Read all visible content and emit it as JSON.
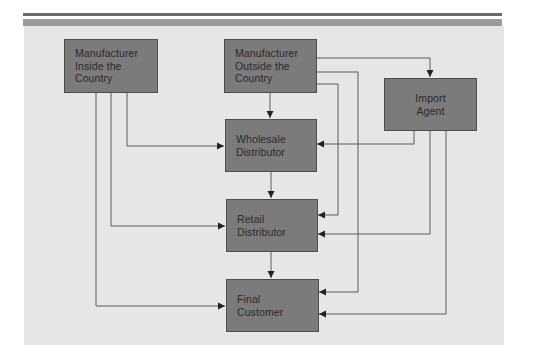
{
  "diagram": {
    "type": "flowchart",
    "title": "",
    "colors": {
      "panel_bg": "#e6e6e6",
      "box_fill": "#7b7b7b",
      "box_border": "#4e4e4e",
      "line": "#555555",
      "text": "#2a2a2a"
    },
    "nodes": [
      {
        "id": "mfr_inside",
        "label": "Manufacturer\nInside the\nCountry"
      },
      {
        "id": "mfr_outside",
        "label": "Manufacturer\nOutside the\nCountry"
      },
      {
        "id": "import_agent",
        "label": "Import\nAgent"
      },
      {
        "id": "wholesale",
        "label": "Wholesale\nDistributor"
      },
      {
        "id": "retail",
        "label": "Retail\nDistributor"
      },
      {
        "id": "final",
        "label": "Final\nCustomer"
      }
    ],
    "edges": [
      {
        "from": "mfr_inside",
        "to": "wholesale"
      },
      {
        "from": "mfr_inside",
        "to": "retail"
      },
      {
        "from": "mfr_inside",
        "to": "final"
      },
      {
        "from": "mfr_outside",
        "to": "wholesale"
      },
      {
        "from": "mfr_outside",
        "to": "import_agent"
      },
      {
        "from": "mfr_outside",
        "to": "retail"
      },
      {
        "from": "mfr_outside",
        "to": "final"
      },
      {
        "from": "import_agent",
        "to": "wholesale"
      },
      {
        "from": "import_agent",
        "to": "retail"
      },
      {
        "from": "import_agent",
        "to": "final"
      },
      {
        "from": "wholesale",
        "to": "retail"
      },
      {
        "from": "retail",
        "to": "final"
      }
    ]
  }
}
